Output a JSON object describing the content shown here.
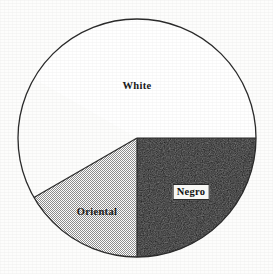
{
  "figure": {
    "background_color": "#fdfdfc",
    "outline_color": "#2b2b2b",
    "center_x": 137,
    "center_y": 138,
    "radius": 119
  },
  "labels": {
    "white": "White",
    "oriental": "Oriental",
    "negro": "Negro"
  },
  "chart_data": {
    "type": "pie",
    "title": "",
    "subtitle": "",
    "xlabel": "",
    "ylabel": "",
    "legend": "none",
    "grid": false,
    "labels_position": "inside-slice",
    "categories": [
      "White",
      "Negro",
      "Oriental"
    ],
    "values": [
      58.3,
      25.0,
      16.7
    ],
    "units": "percent",
    "start_angle_deg": -150,
    "direction": "clockwise",
    "slices": [
      {
        "name": "White",
        "value": 58.3,
        "angle_deg": 210,
        "start_angle_deg": -150,
        "end_angle_deg": 0,
        "fill": "none",
        "fill_color": "#ffffff",
        "label": "White",
        "label_x": 137,
        "label_y": 86,
        "label_boxed": false
      },
      {
        "name": "Negro",
        "value": 25.0,
        "angle_deg": 90,
        "start_angle_deg": 0,
        "end_angle_deg": 90,
        "fill": "solid",
        "fill_color": "#0d0d0d",
        "label": "Negro",
        "label_x": 191,
        "label_y": 192,
        "label_boxed": true
      },
      {
        "name": "Oriental",
        "value": 16.7,
        "angle_deg": 60,
        "start_angle_deg": 90,
        "end_angle_deg": 150,
        "fill": "stipple",
        "fill_color": "#d9d9d9",
        "label": "Oriental",
        "label_x": 97,
        "label_y": 212,
        "label_boxed": false
      }
    ]
  }
}
